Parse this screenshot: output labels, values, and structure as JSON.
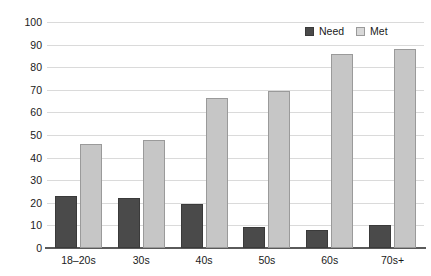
{
  "chart_data": {
    "type": "bar",
    "title": "",
    "subtitle": "",
    "xlabel": "",
    "ylabel": "",
    "categories": [
      "18–20s",
      "30s",
      "40s",
      "50s",
      "60s",
      "70s+"
    ],
    "series": [
      {
        "name": "Need",
        "color": "#4a4a4a",
        "values": [
          23,
          22,
          19.5,
          9.5,
          8,
          10
        ]
      },
      {
        "name": "Met",
        "color": "#c6c6c6",
        "values": [
          46,
          48,
          66.5,
          69.5,
          86,
          88
        ]
      }
    ],
    "ylim": [
      0,
      100
    ],
    "ytick_labels": [
      "0",
      "10",
      "20",
      "30",
      "40",
      "50",
      "60",
      "70",
      "80",
      "90",
      "100"
    ],
    "ytick_values": [
      0,
      10,
      20,
      30,
      40,
      50,
      60,
      70,
      80,
      90,
      100
    ],
    "grid": true,
    "grid_axis": "y",
    "legend_position": "top-right",
    "annotations": []
  },
  "colors": {
    "need": "#4a4a4a",
    "need_border": "#3a3a3a",
    "met": "#c6c6c6",
    "met_border": "#9a9a9a",
    "gridline": "#dadada",
    "axis": "#5a5a5a",
    "text": "#1a1a1a",
    "background": "#ffffff"
  }
}
